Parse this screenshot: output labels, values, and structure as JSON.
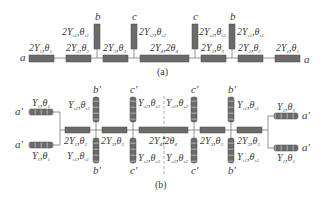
{
  "figure": {
    "colors": {
      "line": "#7a7a7a",
      "segment_fill": "#6b6b6b",
      "segment_stroke": "#4a4a4a",
      "dashed_fill": "#6b6b6b",
      "text": "#3a3a3a"
    },
    "a": {
      "caption": "(a)",
      "ports": {
        "left": "a",
        "right": "a"
      },
      "main_segments": [
        {
          "label": "2Y1,θ1",
          "Y": "2Y",
          "Ysub": "1",
          "T": "θ",
          "Tsub": "1"
        },
        {
          "label": "2Y2,θ2",
          "Y": "2Y",
          "Ysub": "2",
          "T": "θ",
          "Tsub": "2"
        },
        {
          "label": "2Y3,θ3",
          "Y": "2Y",
          "Ysub": "3",
          "T": "θ",
          "Tsub": "3"
        },
        {
          "label": "2Y4,2θ4",
          "Y": "2Y",
          "Ysub": "4",
          "T": "2θ",
          "Tsub": "4"
        },
        {
          "label": "2Y3,θ3",
          "Y": "2Y",
          "Ysub": "3",
          "T": "θ",
          "Tsub": "3"
        },
        {
          "label": "2Y2,θ2",
          "Y": "2Y",
          "Ysub": "2",
          "T": "θ",
          "Tsub": "2"
        },
        {
          "label": "2Y1,θ1",
          "Y": "2Y",
          "Ysub": "1",
          "T": "θ",
          "Tsub": "1"
        }
      ],
      "stubs": [
        {
          "port": "b",
          "label": "2Ys1,θs1",
          "Y": "2Y",
          "Ysub": "s1",
          "T": "θ",
          "Tsub": "s1"
        },
        {
          "port": "c",
          "label": "2Ys2,θs2",
          "Y": "2Y",
          "Ysub": "s2",
          "T": "θ",
          "Tsub": "s2"
        },
        {
          "port": "c",
          "label": "2Ys2,θs2",
          "Y": "2Y",
          "Ysub": "s2",
          "T": "θ",
          "Tsub": "s2"
        },
        {
          "port": "b",
          "label": "2Ys1,θs1",
          "Y": "2Y",
          "Ysub": "s1",
          "T": "θ",
          "Tsub": "s1"
        }
      ]
    },
    "b": {
      "caption": "(b)",
      "ports": {
        "left_top": "a'",
        "left_bottom": "a'",
        "right_top": "a'",
        "right_bottom": "a'"
      },
      "fork_segments": [
        {
          "label": "Y1,θ1",
          "Y": "Y",
          "Ysub": "1",
          "T": "θ",
          "Tsub": "1"
        }
      ],
      "main_segments": [
        {
          "label": "2Y2,θ2",
          "Y": "2Y",
          "Ysub": "2",
          "T": "θ",
          "Tsub": "2"
        },
        {
          "label": "2Y3,θ3",
          "Y": "2Y",
          "Ysub": "3",
          "T": "θ",
          "Tsub": "3"
        },
        {
          "label": "2Y4,2θ4",
          "Y": "2Y",
          "Ysub": "4",
          "T": "2θ",
          "Tsub": "4"
        },
        {
          "label": "2Y3,θ3",
          "Y": "2Y",
          "Ysub": "3",
          "T": "θ",
          "Tsub": "3"
        },
        {
          "label": "2Y2,θ2",
          "Y": "2Y",
          "Ysub": "2",
          "T": "θ",
          "Tsub": "2"
        }
      ],
      "stubs": [
        {
          "port": "b'",
          "label": "Ys1,θs1",
          "Y": "Y",
          "Ysub": "s1",
          "T": "θ",
          "Tsub": "s1"
        },
        {
          "port": "c'",
          "label": "Ys2,θs2",
          "Y": "Y",
          "Ysub": "s2",
          "T": "θ",
          "Tsub": "s2"
        }
      ]
    }
  }
}
